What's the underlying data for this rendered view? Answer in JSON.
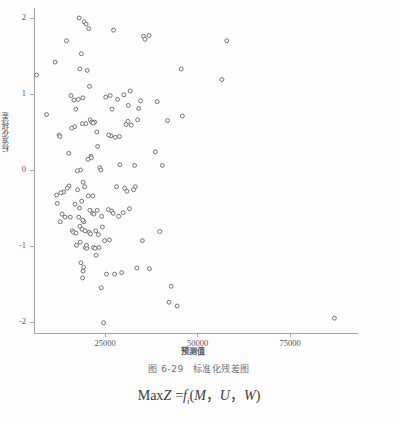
{
  "figure": {
    "caption_number": "图 6-29",
    "caption_text": "标准化残差图"
  },
  "formula": {
    "lhs": "Max",
    "lhs_var": "Z",
    "eq": "=",
    "fn": "f",
    "fn_sub": "i",
    "open": "(",
    "arg1": "M",
    "comma1": "，",
    "arg2": "U",
    "comma2": "，",
    "arg3": "W",
    "close": ")"
  },
  "chart_data": {
    "type": "scatter",
    "title": "",
    "xlabel": "预测值",
    "ylabel": "标准化残差",
    "xlim": [
      2000,
      92000
    ],
    "ylim": [
      -2.25,
      2.18
    ],
    "xticks": [
      25000,
      50000,
      75000
    ],
    "xtick_labels": [
      "25000",
      "50000",
      "75000"
    ],
    "yticks": [
      -2,
      -1,
      0,
      1,
      2
    ],
    "ytick_labels": [
      "-2",
      "-1",
      "0",
      "1",
      "2"
    ],
    "grid": false,
    "legend": null,
    "marker": "open-circle",
    "marker_color": "#6b6b70",
    "marker_size": 3.2,
    "axis_color": "#9a9a9a",
    "n_points": 140,
    "points": [
      [
        6500,
        1.25
      ],
      [
        11500,
        1.42
      ],
      [
        9200,
        0.73
      ],
      [
        12600,
        0.46
      ],
      [
        14600,
        1.7
      ],
      [
        15800,
        0.98
      ],
      [
        16600,
        0.92
      ],
      [
        15200,
        0.22
      ],
      [
        13800,
        -0.29
      ],
      [
        11900,
        -0.33
      ],
      [
        12100,
        -0.44
      ],
      [
        13400,
        -0.58
      ],
      [
        12900,
        -0.68
      ],
      [
        14200,
        -0.62
      ],
      [
        15300,
        -0.21
      ],
      [
        16800,
        0.57
      ],
      [
        17100,
        0.8
      ],
      [
        17600,
        -0.26
      ],
      [
        16200,
        -0.8
      ],
      [
        16500,
        -0.82
      ],
      [
        17200,
        -0.83
      ],
      [
        18200,
        1.33
      ],
      [
        18600,
        1.53
      ],
      [
        18000,
        2.0
      ],
      [
        19400,
        1.95
      ],
      [
        19900,
        1.92
      ],
      [
        20600,
        1.86
      ],
      [
        20200,
        1.31
      ],
      [
        19000,
        0.95
      ],
      [
        19800,
        0.61
      ],
      [
        18900,
        0.61
      ],
      [
        18400,
        0.0
      ],
      [
        17500,
        -0.01
      ],
      [
        19100,
        -0.16
      ],
      [
        19500,
        -0.22
      ],
      [
        18700,
        -0.41
      ],
      [
        18100,
        -0.5
      ],
      [
        17900,
        -0.62
      ],
      [
        19300,
        -0.68
      ],
      [
        18800,
        -0.78
      ],
      [
        19600,
        -0.8
      ],
      [
        18300,
        -0.95
      ],
      [
        19700,
        -1.02
      ],
      [
        20100,
        -1.03
      ],
      [
        18500,
        -1.22
      ],
      [
        19200,
        -1.28
      ],
      [
        19050,
        -1.33
      ],
      [
        18950,
        -1.42
      ],
      [
        20800,
        1.1
      ],
      [
        21000,
        0.66
      ],
      [
        21400,
        0.63
      ],
      [
        21200,
        0.18
      ],
      [
        21300,
        0.16
      ],
      [
        20500,
        -0.34
      ],
      [
        20900,
        -0.53
      ],
      [
        21600,
        -0.57
      ],
      [
        20700,
        -0.82
      ],
      [
        21100,
        -0.84
      ],
      [
        21900,
        -1.02
      ],
      [
        22300,
        -1.03
      ],
      [
        22600,
        -1.12
      ],
      [
        22200,
        0.63
      ],
      [
        22800,
        0.5
      ],
      [
        23000,
        0.31
      ],
      [
        23600,
        0.03
      ],
      [
        23900,
        0.0
      ],
      [
        24300,
        -0.75
      ],
      [
        24000,
        -1.55
      ],
      [
        24600,
        -2.01
      ],
      [
        25400,
        -1.37
      ],
      [
        26400,
        0.98
      ],
      [
        26900,
        0.8
      ],
      [
        27300,
        1.84
      ],
      [
        28400,
        0.93
      ],
      [
        28900,
        0.44
      ],
      [
        27800,
        0.43
      ],
      [
        28100,
        -0.22
      ],
      [
        26800,
        -0.54
      ],
      [
        27200,
        -0.57
      ],
      [
        28700,
        -0.61
      ],
      [
        26200,
        -0.92
      ],
      [
        29500,
        -1.35
      ],
      [
        30300,
        -0.24
      ],
      [
        30700,
        0.6
      ],
      [
        31300,
        0.85
      ],
      [
        31800,
        1.04
      ],
      [
        31200,
        0.64
      ],
      [
        30900,
        -0.28
      ],
      [
        31600,
        -0.51
      ],
      [
        33200,
        -0.22
      ],
      [
        33800,
        0.66
      ],
      [
        34100,
        0.81
      ],
      [
        34600,
        0.91
      ],
      [
        35400,
        1.76
      ],
      [
        35800,
        1.72
      ],
      [
        36900,
        1.77
      ],
      [
        35100,
        -0.93
      ],
      [
        37000,
        -1.3
      ],
      [
        33600,
        -1.29
      ],
      [
        39100,
        0.9
      ],
      [
        38600,
        0.24
      ],
      [
        40500,
        0.06
      ],
      [
        39800,
        -0.81
      ],
      [
        41900,
        0.65
      ],
      [
        45600,
        1.33
      ],
      [
        45900,
        0.71
      ],
      [
        42900,
        -1.53
      ],
      [
        42300,
        -1.74
      ],
      [
        44500,
        -1.79
      ],
      [
        56600,
        1.19
      ],
      [
        57900,
        1.7
      ],
      [
        87000,
        -1.95
      ],
      [
        12800,
        0.44
      ],
      [
        13100,
        -0.3
      ],
      [
        14800,
        -0.24
      ],
      [
        16000,
        0.55
      ],
      [
        17800,
        0.93
      ],
      [
        20400,
        0.14
      ],
      [
        21700,
        -0.34
      ],
      [
        22000,
        -0.58
      ],
      [
        22500,
        -0.8
      ],
      [
        23200,
        -0.85
      ],
      [
        23400,
        -1.02
      ],
      [
        24900,
        -0.93
      ],
      [
        25900,
        -0.52
      ],
      [
        26600,
        0.45
      ],
      [
        27600,
        -1.37
      ],
      [
        29000,
        0.07
      ],
      [
        29900,
        -0.56
      ],
      [
        30100,
        0.99
      ],
      [
        32100,
        0.59
      ],
      [
        32700,
        -0.26
      ],
      [
        18200,
        -0.74
      ],
      [
        19000,
        -0.66
      ],
      [
        17300,
        -0.99
      ],
      [
        20000,
        -0.99
      ],
      [
        16900,
        -0.45
      ],
      [
        15600,
        -0.62
      ],
      [
        21800,
        0.62
      ],
      [
        22900,
        -0.53
      ],
      [
        24100,
        -0.61
      ],
      [
        25200,
        0.96
      ],
      [
        26000,
        0.46
      ],
      [
        33000,
        0.06
      ]
    ]
  }
}
